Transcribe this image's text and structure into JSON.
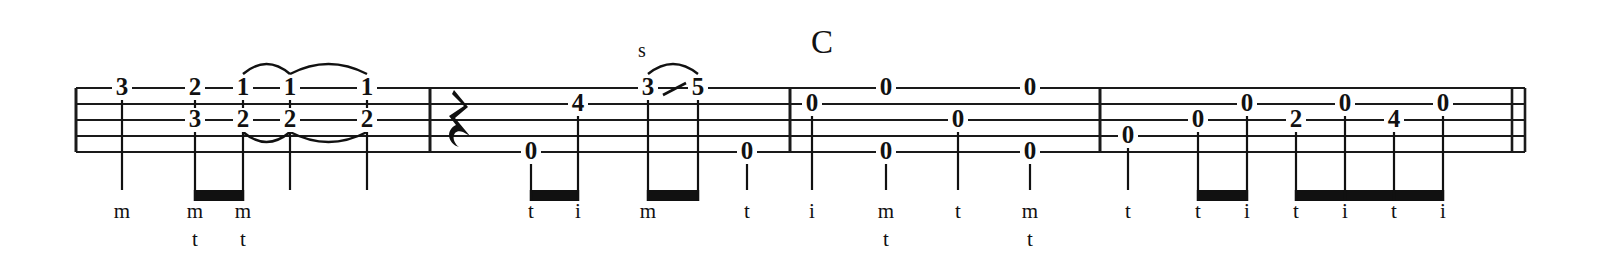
{
  "notation": {
    "type": "banjo-tablature",
    "staff": {
      "string_count": 5,
      "line_count": 5,
      "top_y": 88,
      "line_spacing": 16,
      "left_x": 76,
      "right_x": 1525
    },
    "measures": [
      {
        "index": 1,
        "start_x": 76,
        "end_x": 430,
        "notes": [
          {
            "fret": "3",
            "string": 1,
            "x": 122,
            "stem": true,
            "beam_group": null,
            "finger": "m",
            "finger2": ""
          },
          {
            "fret": "2",
            "string": 1,
            "x": 195,
            "stem": true,
            "beam_group": "m1a",
            "finger": "m",
            "finger2": "t"
          },
          {
            "fret": "3",
            "string": 3,
            "x": 195,
            "stem": false,
            "beam_group": null,
            "finger": "",
            "finger2": ""
          },
          {
            "fret": "1",
            "string": 1,
            "x": 243,
            "stem": true,
            "beam_group": "m1a",
            "finger": "m",
            "finger2": "t"
          },
          {
            "fret": "2",
            "string": 3,
            "x": 243,
            "stem": false,
            "beam_group": null,
            "finger": "",
            "finger2": ""
          },
          {
            "fret": "1",
            "string": 1,
            "x": 290,
            "stem": true,
            "beam_group": null,
            "finger": "",
            "finger2": ""
          },
          {
            "fret": "2",
            "string": 3,
            "x": 290,
            "stem": false,
            "beam_group": null,
            "finger": "",
            "finger2": ""
          },
          {
            "fret": "1",
            "string": 1,
            "x": 367,
            "stem": true,
            "beam_group": null,
            "finger": "",
            "finger2": ""
          },
          {
            "fret": "2",
            "string": 3,
            "x": 367,
            "stem": false,
            "beam_group": null,
            "finger": "",
            "finger2": ""
          }
        ],
        "beams": [
          {
            "id": "m1a",
            "x1": 195,
            "x2": 243,
            "y": 190
          }
        ],
        "slurs": [
          {
            "from_x": 243,
            "to_x": 290,
            "y": 74,
            "direction": "up"
          },
          {
            "from_x": 290,
            "to_x": 367,
            "y": 74,
            "direction": "up"
          },
          {
            "from_x": 243,
            "to_x": 290,
            "y": 132,
            "direction": "down"
          },
          {
            "from_x": 290,
            "to_x": 367,
            "y": 132,
            "direction": "down"
          }
        ]
      },
      {
        "index": 2,
        "start_x": 430,
        "end_x": 790,
        "rest": {
          "type": "quarter",
          "x": 462,
          "y": 120
        },
        "notes": [
          {
            "fret": "0",
            "string": 5,
            "x": 531,
            "stem": true,
            "beam_group": "m2a",
            "finger": "t",
            "finger2": ""
          },
          {
            "fret": "4",
            "string": 2,
            "x": 578,
            "stem": true,
            "beam_group": "m2a",
            "finger": "i",
            "finger2": ""
          },
          {
            "fret": "3",
            "string": 1,
            "x": 648,
            "stem": true,
            "beam_group": "m2b",
            "finger": "m",
            "finger2": ""
          },
          {
            "fret": "5",
            "string": 1,
            "x": 698,
            "stem": true,
            "beam_group": "m2b",
            "finger": "",
            "finger2": ""
          },
          {
            "fret": "0",
            "string": 5,
            "x": 747,
            "stem": true,
            "beam_group": null,
            "finger": "t",
            "finger2": ""
          }
        ],
        "beams": [
          {
            "id": "m2a",
            "x1": 531,
            "x2": 578,
            "y": 190
          },
          {
            "id": "m2b",
            "x1": 648,
            "x2": 698,
            "y": 190
          }
        ],
        "slurs": [
          {
            "from_x": 648,
            "to_x": 698,
            "y": 74,
            "direction": "up"
          }
        ],
        "articulations": [
          {
            "label": "s",
            "x": 642,
            "y": 52,
            "meaning": "slide"
          }
        ],
        "slide_lines": [
          {
            "x1": 663,
            "y1": 95,
            "x2": 686,
            "y2": 83
          }
        ]
      },
      {
        "index": 3,
        "start_x": 790,
        "end_x": 1100,
        "chord": {
          "label": "C",
          "x": 822,
          "y": 45
        },
        "notes": [
          {
            "fret": "0",
            "string": 2,
            "x": 812,
            "stem": true,
            "beam_group": null,
            "finger": "i",
            "finger2": ""
          },
          {
            "fret": "0",
            "string": 1,
            "x": 886,
            "stem": false,
            "beam_group": null,
            "finger": "",
            "finger2": ""
          },
          {
            "fret": "0",
            "string": 5,
            "x": 886,
            "stem": true,
            "beam_group": null,
            "finger": "m",
            "finger2": "t"
          },
          {
            "fret": "0",
            "string": 3,
            "x": 958,
            "stem": true,
            "beam_group": null,
            "finger": "t",
            "finger2": ""
          },
          {
            "fret": "0",
            "string": 1,
            "x": 1030,
            "stem": false,
            "beam_group": null,
            "finger": "",
            "finger2": ""
          },
          {
            "fret": "0",
            "string": 5,
            "x": 1030,
            "stem": true,
            "beam_group": null,
            "finger": "m",
            "finger2": "t"
          }
        ],
        "beams": [],
        "slurs": []
      },
      {
        "index": 4,
        "start_x": 1100,
        "end_x": 1525,
        "notes": [
          {
            "fret": "0",
            "string": 4,
            "x": 1128,
            "stem": true,
            "beam_group": null,
            "finger": "t",
            "finger2": ""
          },
          {
            "fret": "0",
            "string": 3,
            "x": 1198,
            "stem": true,
            "beam_group": "m4a",
            "finger": "t",
            "finger2": ""
          },
          {
            "fret": "0",
            "string": 2,
            "x": 1247,
            "stem": true,
            "beam_group": "m4a",
            "finger": "i",
            "finger2": ""
          },
          {
            "fret": "2",
            "string": 3,
            "x": 1296,
            "stem": true,
            "beam_group": "m4b",
            "finger": "t",
            "finger2": ""
          },
          {
            "fret": "0",
            "string": 2,
            "x": 1345,
            "stem": true,
            "beam_group": "m4b",
            "finger": "i",
            "finger2": ""
          },
          {
            "fret": "4",
            "string": 3,
            "x": 1394,
            "stem": true,
            "beam_group": "m4b",
            "finger": "t",
            "finger2": ""
          },
          {
            "fret": "0",
            "string": 2,
            "x": 1443,
            "stem": true,
            "beam_group": "m4b",
            "finger": "i",
            "finger2": ""
          }
        ],
        "beams": [
          {
            "id": "m4a",
            "x1": 1198,
            "x2": 1247,
            "y": 190
          },
          {
            "id": "m4b",
            "x1": 1296,
            "x2": 1443,
            "y": 190
          }
        ],
        "slurs": []
      }
    ],
    "finger_row_y": 213,
    "finger_row2_y": 241,
    "end_barline": {
      "x1": 1512,
      "x2": 1525
    },
    "colors": {
      "ink": "#111111",
      "staff": "#1a1a1a",
      "background": "#ffffff"
    }
  }
}
